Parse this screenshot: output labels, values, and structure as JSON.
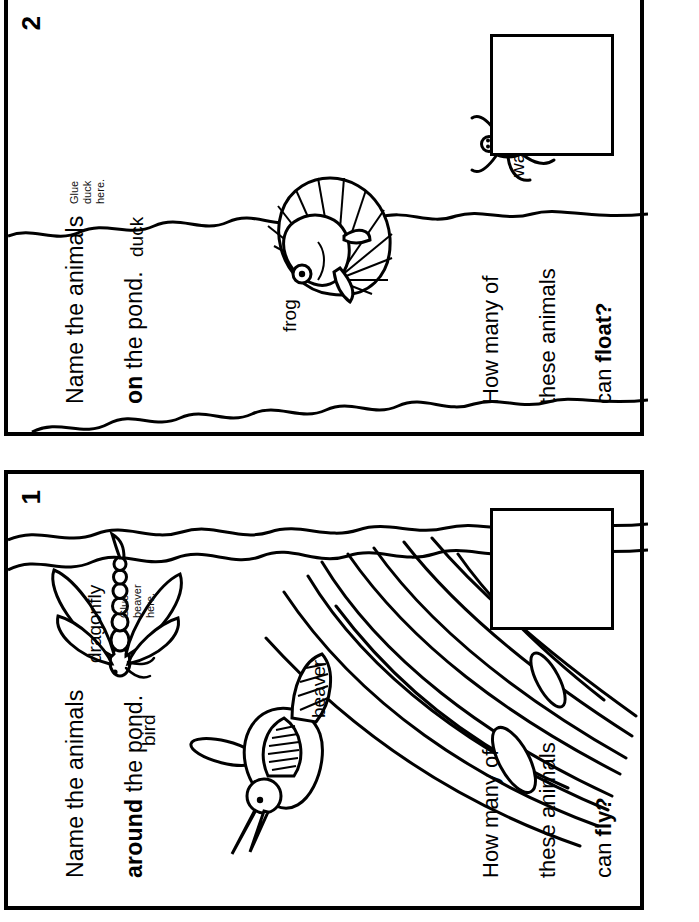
{
  "document": {
    "type": "worksheet",
    "subject": "Pond animals cut-and-paste booklet",
    "orientation": "landscape-rotated",
    "ink_color": "#000000",
    "paper_color": "#ffffff"
  },
  "pages": [
    {
      "number": "2",
      "title_line1": "Name the animals",
      "title_bold": "on",
      "title_rest": " the pond.",
      "question_line1": "How many of",
      "question_line2": "these animals",
      "question_line3_prefix": "can ",
      "question_line3_bold": "float?",
      "glue_note": "Glue\nduck\nhere.",
      "answer_box_label": "",
      "labels": [
        {
          "name": "duck",
          "text": "duck"
        },
        {
          "name": "frog",
          "text": "frog"
        },
        {
          "name": "water-bug",
          "text": "water bug"
        }
      ],
      "artwork": [
        "frog-on-lily-pad",
        "water-bug",
        "pond-waterline"
      ]
    },
    {
      "number": "1",
      "title_line1": "Name the animals",
      "title_bold": "around",
      "title_rest": " the pond.",
      "question_line1": "How many of",
      "question_line2": "these animals",
      "question_line3_prefix": "can ",
      "question_line3_bold": "fly?",
      "glue_note": "Glue\nbeaver\nhere.",
      "answer_box_label": "",
      "labels": [
        {
          "name": "bird",
          "text": "bird"
        },
        {
          "name": "dragonfly",
          "text": "dragonfly"
        },
        {
          "name": "beaver",
          "text": "beaver"
        }
      ],
      "artwork": [
        "bird-on-cattails",
        "dragonfly",
        "cattail-reeds",
        "pond-waterline"
      ]
    }
  ]
}
